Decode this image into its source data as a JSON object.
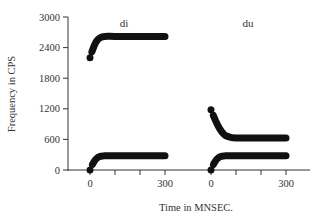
{
  "chart_data": {
    "type": "line",
    "title": "",
    "xlabel": "Time in MNSEC.",
    "ylabel": "Frequency in CPS",
    "ylim": [
      0,
      3000
    ],
    "yticks": [
      0,
      600,
      1200,
      1800,
      2400,
      3000
    ],
    "ytick_labels": [
      "0",
      "600",
      "1200",
      "1800",
      "2400",
      "3000"
    ],
    "grid": false,
    "legend": null,
    "panels": [
      {
        "label": "di",
        "xlim": [
          0,
          300
        ],
        "xticks": [
          0,
          100,
          200,
          300
        ],
        "xtick_labels": [
          "0",
          "",
          "",
          "300"
        ],
        "series": [
          {
            "name": "F1",
            "x": [
              0,
              10,
              20,
              30,
              40,
              50,
              60,
              100,
              200,
              300
            ],
            "values": [
              0,
              110,
              190,
              240,
              265,
              275,
              280,
              280,
              280,
              280
            ]
          },
          {
            "name": "F2",
            "x": [
              0,
              10,
              20,
              30,
              40,
              50,
              60,
              100,
              200,
              300
            ],
            "values": [
              2200,
              2350,
              2470,
              2550,
              2590,
              2610,
              2620,
              2620,
              2620,
              2620
            ]
          }
        ]
      },
      {
        "label": "du",
        "xlim": [
          0,
          300
        ],
        "xticks": [
          0,
          100,
          200,
          300
        ],
        "xtick_labels": [
          "0",
          "",
          "",
          "300"
        ],
        "series": [
          {
            "name": "F1",
            "x": [
              0,
              10,
              20,
              30,
              40,
              50,
              60,
              100,
              200,
              300
            ],
            "values": [
              0,
              110,
              190,
              240,
              265,
              275,
              280,
              280,
              280,
              280
            ]
          },
          {
            "name": "F2",
            "x": [
              0,
              10,
              20,
              30,
              40,
              50,
              60,
              80,
              100,
              200,
              300
            ],
            "values": [
              1180,
              1060,
              950,
              850,
              770,
              710,
              670,
              640,
              630,
              630,
              630
            ]
          }
        ]
      }
    ]
  },
  "layout": {
    "stroke_color": "#111111",
    "axis_color": "#333333"
  }
}
